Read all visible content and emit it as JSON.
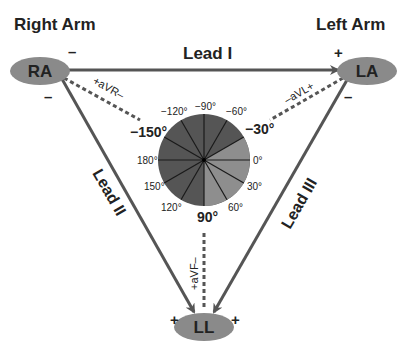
{
  "title_labels": {
    "right_arm": "Right Arm",
    "left_arm": "Left Arm"
  },
  "electrodes": {
    "ra": "RA",
    "la": "LA",
    "ll": "LL"
  },
  "leads": {
    "lead_i": "Lead I",
    "lead_ii": "Lead II",
    "lead_iii": "Lead III",
    "avr": "+aVR–",
    "avl": "–aVL+",
    "avf": "+aVF–"
  },
  "polarity": {
    "ra_top": "–",
    "ra_bottom": "–",
    "la_top": "+",
    "la_bottom": "–",
    "ll_left": "+",
    "ll_right": "+"
  },
  "axis_wheel": {
    "labels": {
      "m90": "−90°",
      "m60": "−60°",
      "m30": "−30°",
      "d0": "0°",
      "d30": "30°",
      "d60": "60°",
      "d90": "90°",
      "d120": "120°",
      "d150": "150°",
      "d180": "180°",
      "m150": "−150°",
      "m120": "−120°"
    },
    "colors": {
      "normal_sector": "#8e8e8e",
      "other_sector": "#555555",
      "lines": "#1a1a1a"
    }
  },
  "colors": {
    "electrode_fill": "#8a8a8a",
    "line": "#555555",
    "text": "#222222"
  }
}
